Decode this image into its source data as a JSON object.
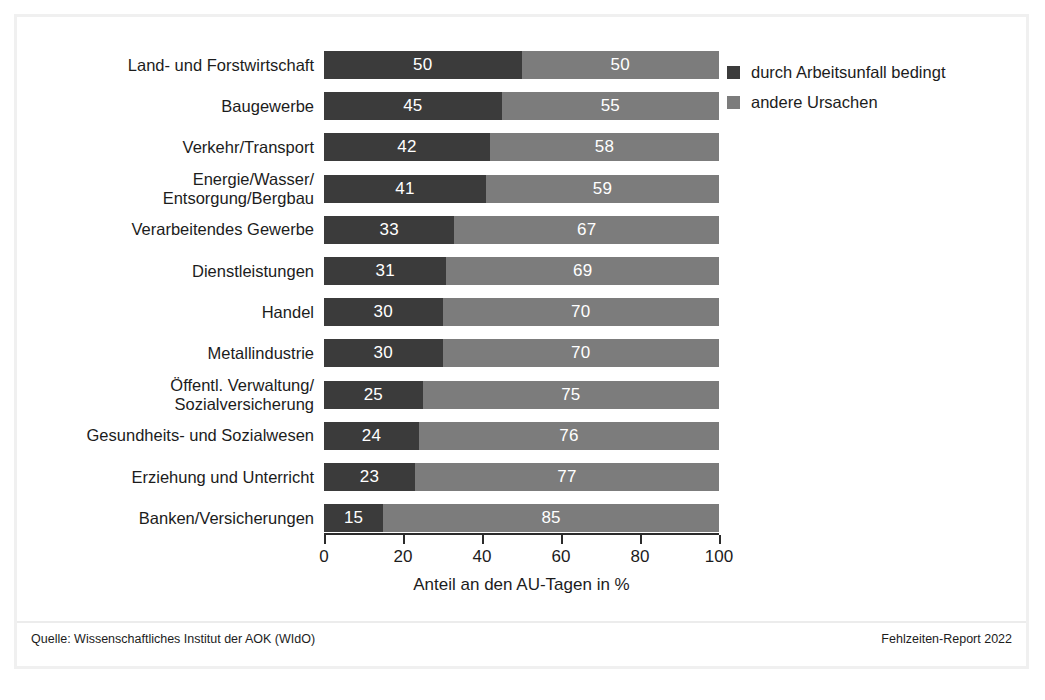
{
  "chart_data": {
    "type": "bar",
    "subtype": "horizontal-stacked-100",
    "title": "",
    "xlabel": "Anteil an den AU-Tagen in %",
    "ylabel": "",
    "xlim": [
      0,
      100
    ],
    "xticks": [
      0,
      20,
      40,
      60,
      80,
      100
    ],
    "xtick_labels": [
      "0",
      "20",
      "40",
      "60",
      "80",
      "100"
    ],
    "grid": false,
    "legend_position": "top-right",
    "categories": [
      "Land- und Forstwirtschaft",
      "Baugewerbe",
      "Verkehr/Transport",
      "Energie/Wasser/\nEntsorgung/Bergbau",
      "Verarbeitendes Gewerbe",
      "Dienstleistungen",
      "Handel",
      "Metallindustrie",
      "Öffentl. Verwaltung/\nSozialversicherung",
      "Gesundheits- und Sozialwesen",
      "Erziehung und Unterricht",
      "Banken/Versicherungen"
    ],
    "series": [
      {
        "name": "durch Arbeitsunfall bedingt",
        "color": "#3b3b3b",
        "values": [
          50,
          45,
          42,
          41,
          33,
          31,
          30,
          30,
          25,
          24,
          23,
          15
        ]
      },
      {
        "name": "andere Ursachen",
        "color": "#7c7c7c",
        "values": [
          50,
          55,
          58,
          59,
          67,
          69,
          70,
          70,
          75,
          76,
          77,
          85
        ]
      }
    ]
  },
  "legend": {
    "items": [
      {
        "label": "durch Arbeitsunfall bedingt",
        "color": "#3b3b3b"
      },
      {
        "label": "andere Ursachen",
        "color": "#7c7c7c"
      }
    ]
  },
  "axis": {
    "x_title": "Anteil an den AU-Tagen in %",
    "tick_labels": [
      "0",
      "20",
      "40",
      "60",
      "80",
      "100"
    ]
  },
  "footer": {
    "source": "Quelle: Wissenschaftliches Institut der AOK (WIdO)",
    "report": "Fehlzeiten-Report 2022"
  }
}
